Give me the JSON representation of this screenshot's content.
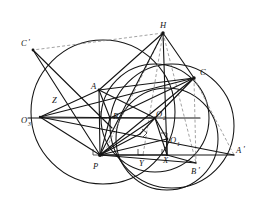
{
  "figure": {
    "type": "geometry-diagram",
    "background_color": "#ffffff",
    "stroke_color": "#141414",
    "dashed_color": "#8a8a8a",
    "top_strip_text": "— — □ — □ — — □ — — □ — □ — □ —"
  },
  "points": [
    {
      "id": "H",
      "label": "H",
      "sub": "",
      "x": 163,
      "y": 33,
      "lx": 161,
      "ly": 27,
      "dot": true
    },
    {
      "id": "Cp",
      "label": "C",
      "sub": "",
      "prime": true,
      "x": 33,
      "y": 50,
      "lx": 24,
      "ly": 46,
      "dot": true
    },
    {
      "id": "C",
      "label": "C",
      "sub": "",
      "x": 194,
      "y": 78,
      "lx": 200,
      "ly": 74,
      "dot": true
    },
    {
      "id": "A",
      "label": "A",
      "sub": "",
      "x": 99,
      "y": 90,
      "lx": 93,
      "ly": 88,
      "dot": true
    },
    {
      "id": "Z",
      "label": "Z",
      "sub": "",
      "x": 62,
      "y": 101,
      "lx": 54,
      "ly": 101,
      "dot": false
    },
    {
      "id": "B",
      "label": "B",
      "sub": "",
      "x": 110,
      "y": 118,
      "lx": 112,
      "ly": 118,
      "dot": true
    },
    {
      "id": "O3",
      "label": "O",
      "sub": "3",
      "x": 40,
      "y": 117,
      "lx": 24,
      "ly": 121,
      "dot": false
    },
    {
      "id": "O2",
      "label": "O",
      "sub": "2",
      "x": 155,
      "y": 118,
      "lx": 155,
      "ly": 118,
      "dot": true
    },
    {
      "id": "O1",
      "label": "O",
      "sub": "1",
      "x": 167,
      "y": 139,
      "lx": 170,
      "ly": 142,
      "dot": true
    },
    {
      "id": "X",
      "label": "X",
      "sub": "",
      "x": 167,
      "y": 155,
      "lx": 164,
      "ly": 159,
      "dot": false
    },
    {
      "id": "Y",
      "label": "Y",
      "sub": "",
      "x": 143,
      "y": 155,
      "lx": 141,
      "ly": 163,
      "dot": false
    },
    {
      "id": "P",
      "label": "P",
      "sub": "",
      "x": 100,
      "y": 155,
      "lx": 95,
      "ly": 165,
      "dot": true
    },
    {
      "id": "Bp",
      "label": "B",
      "sub": "",
      "prime": true,
      "x": 196,
      "y": 163,
      "lx": 194,
      "ly": 171,
      "dot": false
    },
    {
      "id": "Ap",
      "label": "A",
      "sub": "",
      "prime": true,
      "x": 234,
      "y": 155,
      "lx": 238,
      "ly": 152,
      "dot": false
    }
  ],
  "circles": [
    {
      "name": "circle-O1-nine-point",
      "cx": 167,
      "cy": 139,
      "r": 51,
      "style": "solid"
    },
    {
      "name": "circle-O2-circumcircle",
      "cx": 155,
      "cy": 118,
      "r": 54,
      "style": "solid"
    },
    {
      "name": "circle-O3-large-left",
      "cx": 103,
      "cy": 112,
      "r": 72,
      "style": "solid"
    },
    {
      "name": "circle-right-small",
      "cx": 172,
      "cy": 126,
      "r": 62,
      "style": "solid"
    }
  ],
  "segments": [
    {
      "name": "seg-H-P",
      "from": "H",
      "to": "P",
      "style": "solid"
    },
    {
      "name": "seg-H-C",
      "from": "H",
      "to": "C",
      "style": "solid"
    },
    {
      "name": "seg-H-A",
      "from": "H",
      "to": "A",
      "style": "solid"
    },
    {
      "name": "seg-H-X",
      "from": "H",
      "to": "X",
      "style": "solid"
    },
    {
      "name": "seg-H-Cp",
      "from": "H",
      "to": "Cp",
      "style": "dashed"
    },
    {
      "name": "seg-H-B",
      "from": "H",
      "to": "B",
      "style": "dashed"
    },
    {
      "name": "seg-H-Y",
      "from": "H",
      "to": "Y",
      "style": "dashed"
    },
    {
      "name": "seg-H-Bp",
      "from": "H",
      "to": "Bp",
      "style": "dashed"
    },
    {
      "name": "seg-A-B",
      "from": "A",
      "to": "B",
      "style": "solid"
    },
    {
      "name": "seg-B-C",
      "from": "B",
      "to": "C",
      "style": "solid"
    },
    {
      "name": "seg-A-C",
      "from": "A",
      "to": "C",
      "style": "solid"
    },
    {
      "name": "seg-A-P",
      "from": "A",
      "to": "P",
      "style": "solid"
    },
    {
      "name": "seg-P-C",
      "from": "P",
      "to": "C",
      "style": "solid"
    },
    {
      "name": "seg-P-B",
      "from": "P",
      "to": "B",
      "style": "solid"
    },
    {
      "name": "seg-P-O2",
      "from": "P",
      "to": "O2",
      "style": "solid"
    },
    {
      "name": "seg-P-O1",
      "from": "P",
      "to": "O1",
      "style": "solid"
    },
    {
      "name": "seg-P-Ap",
      "from": "P",
      "to": "Ap",
      "style": "solid"
    },
    {
      "name": "seg-P-Bp",
      "from": "P",
      "to": "Bp",
      "style": "solid"
    },
    {
      "name": "seg-P-X",
      "from": "P",
      "to": "X",
      "style": "solid"
    },
    {
      "name": "seg-O3-P",
      "from": "O3",
      "to": "P",
      "style": "solid"
    },
    {
      "name": "seg-O3-C",
      "from": "O3",
      "to": "C",
      "style": "solid"
    },
    {
      "name": "seg-O3-Ap",
      "from": "O3",
      "to": "Ap",
      "style": "solid"
    },
    {
      "name": "seg-O3-A",
      "from": "O3",
      "to": "A",
      "style": "solid"
    },
    {
      "name": "seg-Cp-P",
      "from": "Cp",
      "to": "P",
      "style": "solid"
    },
    {
      "name": "seg-Cp-B",
      "from": "Cp",
      "to": "B",
      "style": "solid"
    },
    {
      "name": "seg-O2-O1",
      "from": "O2",
      "to": "O1",
      "style": "solid"
    },
    {
      "name": "seg-O2-X",
      "from": "O2",
      "to": "X",
      "style": "solid"
    },
    {
      "name": "seg-O2-C",
      "from": "O2",
      "to": "C",
      "style": "solid"
    },
    {
      "name": "seg-X-Bp",
      "from": "X",
      "to": "Bp",
      "style": "solid"
    },
    {
      "name": "seg-C-Ap",
      "from": "C",
      "to": "Ap",
      "style": "dashed"
    },
    {
      "name": "seg-C-Bp",
      "from": "C",
      "to": "Bp",
      "style": "dashed"
    }
  ],
  "right_angle_marks": [
    {
      "name": "right-angle-at-B-foot",
      "x": 103,
      "y": 114
    },
    {
      "name": "right-angle-at-Y",
      "x": 140,
      "y": 152
    },
    {
      "name": "right-angle-at-X",
      "x": 164,
      "y": 152
    },
    {
      "name": "right-angle-near-O1",
      "x": 161,
      "y": 133
    },
    {
      "name": "right-angle-near-O2",
      "x": 146,
      "y": 128
    },
    {
      "name": "right-angle-at-P-left",
      "x": 97,
      "y": 152
    }
  ]
}
